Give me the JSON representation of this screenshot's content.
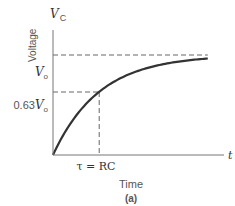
{
  "chart_data": {
    "type": "line",
    "title": "",
    "caption": "(a)",
    "xlabel": "Time",
    "ylabel": "Voltage",
    "y_axis_symbol": "V",
    "y_axis_symbol_sub": "C",
    "x_axis_symbol": "t",
    "x_tick_label": "τ = RC",
    "y_tick_labels": [
      {
        "text": "0.63",
        "sym": "V",
        "sub": "o",
        "value": 0.63
      },
      {
        "text": "",
        "sym": "V",
        "sub": "o",
        "value": 1.0
      }
    ],
    "series": [
      {
        "name": "Vc(t) = Vo(1 - e^(-t/τ))",
        "tau_fraction_of_xmax": 0.27,
        "asymptote": 1.0
      }
    ],
    "guide_lines": [
      {
        "name": "asymptote",
        "y": 1.0
      },
      {
        "name": "63-percent",
        "y": 0.63,
        "x": "tau"
      }
    ],
    "xlim": [
      0,
      3.7
    ],
    "ylim": [
      0,
      1.3
    ],
    "grid": false,
    "legend": "none"
  }
}
